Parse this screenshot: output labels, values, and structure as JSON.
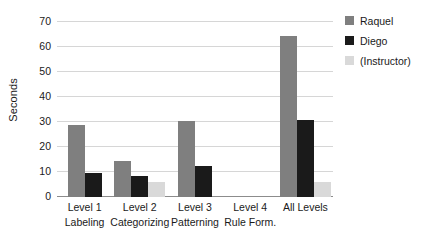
{
  "chart_data": {
    "type": "bar",
    "title": "",
    "xlabel": "",
    "ylabel": "Seconds",
    "ylim": [
      0,
      70
    ],
    "yticks": [
      0,
      10,
      20,
      30,
      40,
      50,
      60,
      70
    ],
    "grid": true,
    "legend_position": "right",
    "categories": [
      "Level 1 Labeling",
      "Level 2 Categorizing",
      "Level 3 Patterning",
      "Level 4 Rule Form.",
      "All Levels"
    ],
    "category_lines": [
      {
        "line1": "Level 1",
        "line2": "Labeling"
      },
      {
        "line1": "Level 2",
        "line2": "Categorizing"
      },
      {
        "line1": "Level 3",
        "line2": "Patterning"
      },
      {
        "line1": "Level 4",
        "line2": "Rule Form."
      },
      {
        "line1": "All Levels",
        "line2": ""
      }
    ],
    "series": [
      {
        "name": "Raquel",
        "color": "#7f7f7f",
        "values": [
          29,
          14.5,
          30.5,
          0,
          64.5
        ]
      },
      {
        "name": "Diego",
        "color": "#1a1a1a",
        "values": [
          9.5,
          8.5,
          12.5,
          0,
          31
        ]
      },
      {
        "name": "(Instructor)",
        "color": "#d9d9d9",
        "values": [
          0,
          6,
          0,
          0,
          6
        ]
      }
    ]
  },
  "legend": {
    "items": [
      {
        "label": "Raquel",
        "color": "#7f7f7f"
      },
      {
        "label": "Diego",
        "color": "#1a1a1a"
      },
      {
        "label": "(Instructor)",
        "color": "#d9d9d9"
      }
    ]
  },
  "axes": {
    "y_title": "Seconds"
  }
}
